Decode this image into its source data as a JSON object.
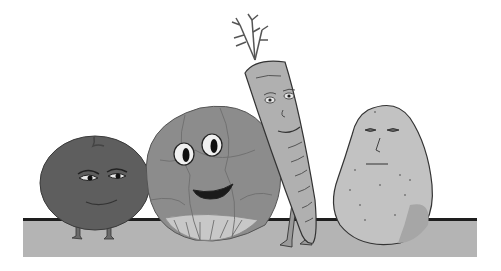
{
  "illustration": {
    "alt": "Cartoon of four vegetables with faces sitting on a shelf",
    "background": "#ffffff",
    "shelf": {
      "top_line_color": "#1e1e1e",
      "body_color": "#b4b4b4"
    },
    "characters": [
      {
        "name": "tomato",
        "color": "#5e5e5e",
        "expression": "smug, half-closed eyes"
      },
      {
        "name": "cabbage",
        "color": "#8c8c8c",
        "expression": "wide eyes, open smile"
      },
      {
        "name": "carrot",
        "color": "#b0b0b0",
        "expression": "gentle smile"
      },
      {
        "name": "potato",
        "color": "#c2c2c2",
        "expression": "neutral"
      }
    ]
  }
}
